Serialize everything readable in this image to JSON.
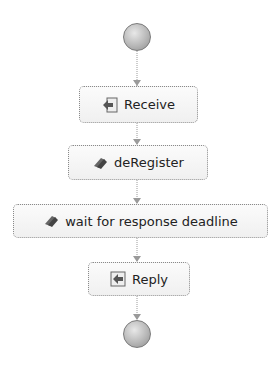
{
  "diagram": {
    "type": "process-flow",
    "start": {
      "label": "start"
    },
    "end": {
      "label": "end"
    },
    "activities": [
      {
        "label": "Receive",
        "icon": "receive-icon"
      },
      {
        "label": "deRegister",
        "icon": "assign-icon"
      },
      {
        "label": "wait for response deadline",
        "icon": "assign-icon"
      },
      {
        "label": "Reply",
        "icon": "reply-icon"
      }
    ],
    "colors": {
      "border": "#8a8a8a",
      "node_fill": "#f4f4f4",
      "connector": "#9a9a9a",
      "circle": "#b0b0b0"
    }
  }
}
